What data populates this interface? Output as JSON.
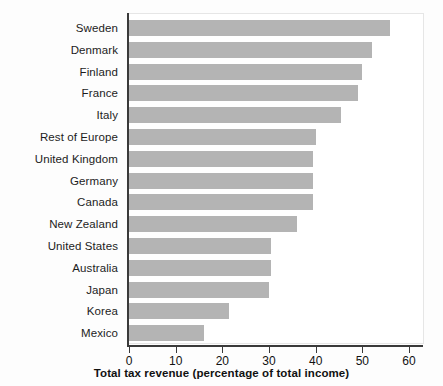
{
  "chart_data": {
    "type": "bar",
    "orientation": "horizontal",
    "title": "",
    "xlabel": "Total tax revenue (percentage of total income)",
    "ylabel": "",
    "xlim": [
      0,
      60
    ],
    "xticks": [
      0,
      10,
      20,
      30,
      40,
      50,
      60
    ],
    "xticklabels": [
      "0",
      "10",
      "20",
      "30",
      "40",
      "50",
      "60"
    ],
    "grid": false,
    "legend": null,
    "bar_color": "#b4b4b4",
    "axis_color": "#3a3a3a",
    "background_color": "#ffffff",
    "categories": [
      "Sweden",
      "Denmark",
      "Finland",
      "France",
      "Italy",
      "Rest of Europe",
      "United Kingdom",
      "Germany",
      "Canada",
      "New Zealand",
      "United States",
      "Australia",
      "Japan",
      "Korea",
      "Mexico"
    ],
    "values": [
      56.0,
      52.0,
      50.0,
      49.0,
      45.5,
      40.0,
      39.5,
      39.5,
      39.5,
      36.0,
      30.5,
      30.5,
      30.0,
      21.5,
      16.0
    ]
  }
}
